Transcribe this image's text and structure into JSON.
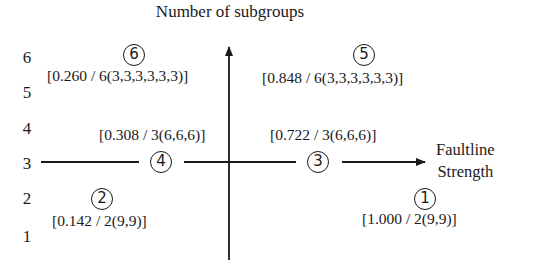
{
  "title": "Number of subgroups",
  "x_axis_label": [
    "Faultline",
    "Strength"
  ],
  "y_ticks": [
    "6",
    "5",
    "4",
    "3",
    "2",
    "1"
  ],
  "points": [
    {
      "id": "1",
      "circle": "1",
      "label": "[1.000 / 2(9,9)]"
    },
    {
      "id": "2",
      "circle": "2",
      "label": "[0.142 / 2(9,9)]"
    },
    {
      "id": "3",
      "circle": "3",
      "label": "[0.722 / 3(6,6,6)]"
    },
    {
      "id": "4",
      "circle": "4",
      "label": "[0.308 / 3(6,6,6)]"
    },
    {
      "id": "5",
      "circle": "5",
      "label": "[0.848 / 6(3,3,3,3,3,3)]"
    },
    {
      "id": "6",
      "circle": "6",
      "label": "[0.260 / 6(3,3,3,3,3,3)]"
    }
  ],
  "colors": {
    "ink": "#1a1a1a",
    "background": "#ffffff"
  }
}
